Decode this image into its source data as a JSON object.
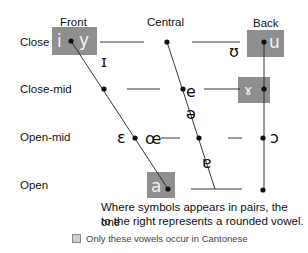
{
  "columns": {
    "front": "Front",
    "central": "Central",
    "back": "Back"
  },
  "rows": {
    "close": "Close",
    "close_mid": "Close-mid",
    "open_mid": "Open-mid",
    "open": "Open"
  },
  "vowels": {
    "close_front_unrounded": "i",
    "close_front_rounded": "y",
    "near_close_front": "ɪ",
    "near_close_back": "ʊ",
    "close_back_rounded": "u",
    "close_mid_central": "e",
    "close_mid_back_unrounded": "ɤ",
    "mid_central": "ə",
    "open_mid_front_unrounded": "ɛ",
    "open_mid_front_rounded": "œ",
    "open_mid_back_rounded": "ɔ",
    "near_open_central": "ɐ",
    "open_front": "a"
  },
  "colors": {
    "highlight_box": "#8f8f8f",
    "line": "#222222"
  },
  "note": {
    "line1": "Where symbols appears in pairs, the one",
    "line2": "to the right represents a rounded vowel."
  },
  "legend": {
    "label": "Only these vowels occur in Cantonese"
  }
}
